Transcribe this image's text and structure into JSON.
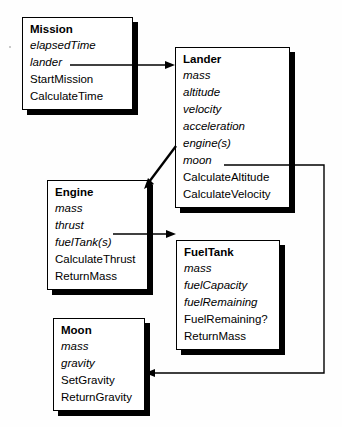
{
  "diagram": {
    "type": "uml-class-diagram",
    "background_color": "#fefefe",
    "line_color": "#000000",
    "shadow_color": "#000000"
  },
  "classes": [
    {
      "id": "mission",
      "name": "Mission",
      "attributes": [
        "elapsedTime",
        "lander"
      ],
      "operations": [
        "StartMission",
        "CalculateTime"
      ]
    },
    {
      "id": "lander",
      "name": "Lander",
      "attributes": [
        "mass",
        "altitude",
        "velocity",
        "acceleration",
        "engine(s)",
        "moon"
      ],
      "operations": [
        "CalculateAltitude",
        "CalculateVelocity"
      ]
    },
    {
      "id": "engine",
      "name": "Engine",
      "attributes": [
        "mass",
        "thrust",
        "fuelTank(s)"
      ],
      "operations": [
        "CalculateThrust",
        "ReturnMass"
      ]
    },
    {
      "id": "fueltank",
      "name": "FuelTank",
      "attributes": [
        "mass",
        "fuelCapacity",
        "fuelRemaining"
      ],
      "operations": [
        "FuelRemaining?",
        "ReturnMass"
      ]
    },
    {
      "id": "moon",
      "name": "Moon",
      "attributes": [
        "mass",
        "gravity"
      ],
      "operations": [
        "SetGravity",
        "ReturnGravity"
      ]
    }
  ],
  "connections": [
    {
      "id": "mission-to-lander",
      "from_class": "Mission",
      "from_attribute": "lander",
      "to_class": "Lander",
      "style": "orthogonal-arrow"
    },
    {
      "id": "lander-to-engine",
      "from_class": "Lander",
      "from_attribute": "engine(s)",
      "to_class": "Engine",
      "style": "diagonal-arrow"
    },
    {
      "id": "lander-to-moon",
      "from_class": "Lander",
      "from_attribute": "moon",
      "to_class": "Moon",
      "style": "orthogonal-arrow"
    },
    {
      "id": "engine-to-fueltank",
      "from_class": "Engine",
      "from_attribute": "fuelTank(s)",
      "to_class": "FuelTank",
      "style": "orthogonal-arrow"
    }
  ]
}
